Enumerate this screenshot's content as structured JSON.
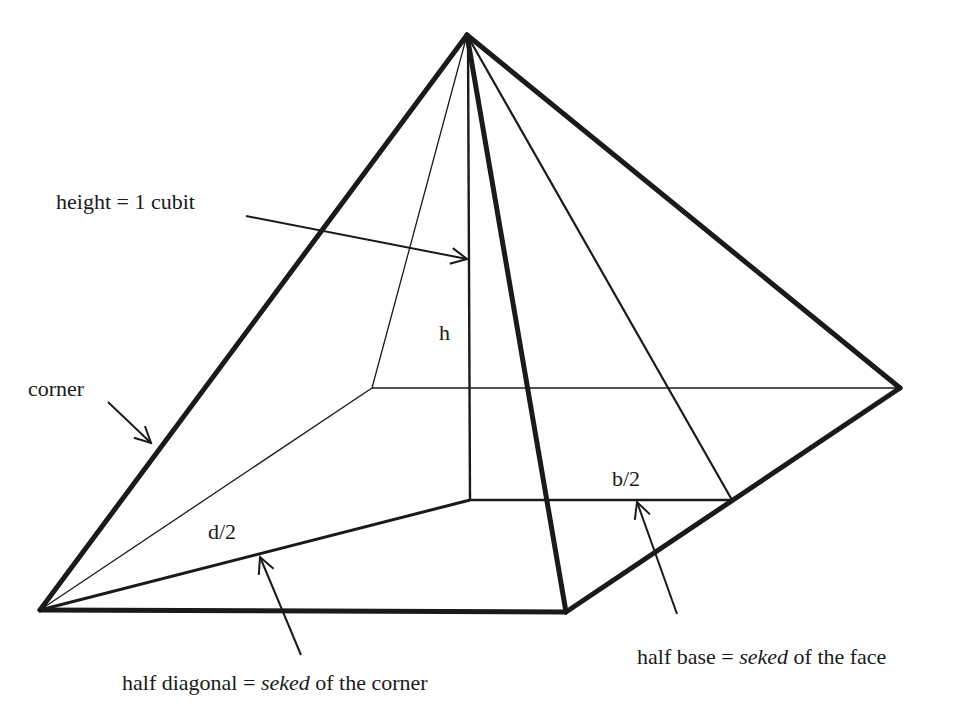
{
  "diagram": {
    "type": "pyramid-seked-geometry",
    "labels": {
      "height": "height = 1 cubit",
      "h": "h",
      "corner": "corner",
      "d_half": "d/2",
      "b_half": "b/2",
      "half_diagonal_prefix": "half diagonal = ",
      "half_diagonal_term": "seked",
      "half_diagonal_suffix": " of the corner",
      "half_base_prefix": "half base = ",
      "half_base_term": "seked",
      "half_base_suffix": " of the face"
    },
    "colors": {
      "line": "#1a1a1a",
      "background": "#ffffff"
    }
  }
}
